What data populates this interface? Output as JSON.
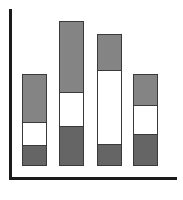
{
  "chart_data": {
    "type": "bar",
    "stacked": true,
    "title": "",
    "xlabel": "",
    "ylabel": "",
    "categories": [
      "",
      "",
      "",
      ""
    ],
    "series": [
      {
        "name": "bottom",
        "color": "#6e6e6e",
        "values": [
          19,
          38,
          20,
          30
        ]
      },
      {
        "name": "middle",
        "color": "#ffffff",
        "values": [
          23,
          34,
          74,
          29
        ]
      },
      {
        "name": "top",
        "color": "#8e8e8e",
        "values": [
          48,
          71,
          36,
          31
        ]
      }
    ],
    "ylim": [
      0,
      157
    ],
    "grid": false,
    "legend": "none",
    "ticks": "none"
  },
  "layout": {
    "bar_left_px": [
      22,
      59,
      97,
      133
    ],
    "px_per_unit": 1
  }
}
